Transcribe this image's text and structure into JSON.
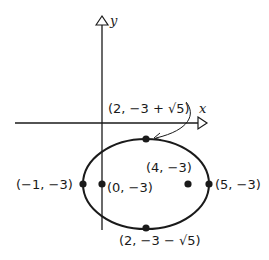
{
  "diagram": {
    "type": "ellipse-on-coordinate-plane",
    "axes": {
      "x_label": "x",
      "y_label": "y"
    },
    "points": {
      "top_vertex": "(2, −3 + √5)",
      "bottom_vertex": "(2, −3 − √5)",
      "left_vertex": "(−1, −3)",
      "right_vertex": "(5, −3)",
      "focus_left": "(0, −3)",
      "focus_right": "(4, −3)"
    },
    "colors": {
      "stroke": "#1a1a1a",
      "background": "#ffffff"
    }
  }
}
